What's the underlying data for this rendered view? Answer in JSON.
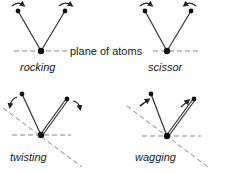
{
  "diagram": {
    "plane_label": "plane of atoms",
    "panels": [
      {
        "id": "rocking",
        "label": "rocking"
      },
      {
        "id": "scissor",
        "label": "scissor"
      },
      {
        "id": "twisting",
        "label": "twisting"
      },
      {
        "id": "wagging",
        "label": "wagging"
      }
    ],
    "colors": {
      "bond": "#333333",
      "atom": "#111111",
      "dash": "#888888",
      "text": "#1a1a1a"
    }
  }
}
